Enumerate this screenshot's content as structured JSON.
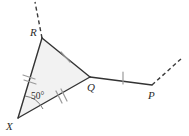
{
  "figure": {
    "background_color": "#ffffff",
    "stroke_color": "#333333",
    "tick_color": "#9a9a9a",
    "fill_color": "#f2f2f2",
    "points": {
      "X": {
        "label": "X",
        "x": 18,
        "y": 118
      },
      "R": {
        "label": "R",
        "x": 42,
        "y": 38
      },
      "Q": {
        "label": "Q",
        "x": 90,
        "y": 77
      },
      "P": {
        "label": "P",
        "x": 152,
        "y": 85
      }
    },
    "labels": {
      "X": "X",
      "R": "R",
      "Q": "Q",
      "P": "P"
    },
    "angle": {
      "at_vertex": "X",
      "value": "50°"
    },
    "segments": [
      {
        "name": "XR",
        "from": "X",
        "to": "R",
        "ticks": 2
      },
      {
        "name": "RQ",
        "from": "R",
        "to": "Q",
        "ticks": 1
      },
      {
        "name": "XQ",
        "from": "X",
        "to": "Q",
        "ticks": 2
      },
      {
        "name": "QP",
        "from": "Q",
        "to": "P",
        "ticks": 1
      }
    ],
    "rays": [
      {
        "name": "ray-beyond-R",
        "style": "dashed",
        "direction": "up-left"
      },
      {
        "name": "ray-beyond-P",
        "style": "dashed",
        "direction": "up-right"
      }
    ]
  }
}
